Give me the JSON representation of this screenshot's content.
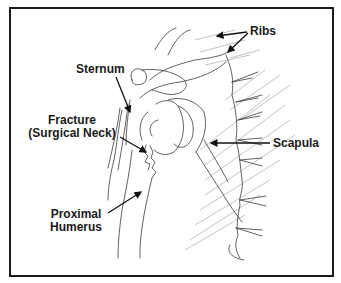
{
  "figure": {
    "type": "anatomical line drawing",
    "labels": {
      "ribs": "Ribs",
      "sternum": "Sternum",
      "fracture_line1": "Fracture",
      "fracture_line2": "(Surgical Neck)",
      "scapula": "Scapula",
      "proximal_line1": "Proximal",
      "proximal_line2": "Humerus"
    },
    "colors": {
      "line": "#1a1a1a",
      "hatch": "#9a9a9a",
      "background": "#ffffff"
    }
  }
}
